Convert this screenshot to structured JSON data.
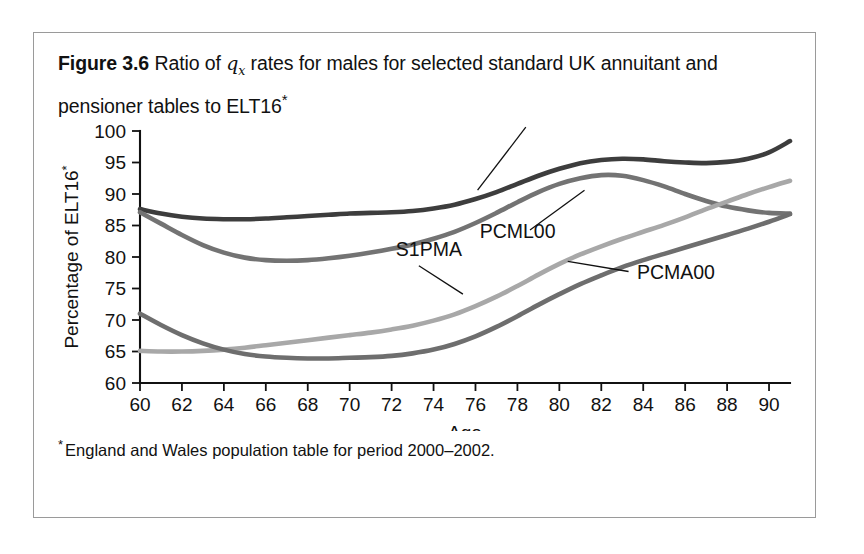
{
  "caption": {
    "figure_label": "Figure 3.6",
    "text_part1": " Ratio of ",
    "math_symbol": "q",
    "math_subscript": "x",
    "text_part2": " rates for males for selected standard UK annuitant and pensioner tables to ELT16",
    "footnote_marker": "*"
  },
  "footnote": {
    "marker": "*",
    "text": "England and Wales population table for period 2000–2002."
  },
  "chart_data": {
    "type": "line",
    "title": "Ratio of qx rates for males for selected standard UK annuitant and pensioner tables to ELT16",
    "xlabel": "Age",
    "ylabel": "Percentage of ELT16*",
    "xlim": [
      60,
      91
    ],
    "ylim": [
      60,
      100
    ],
    "xticks": [
      60,
      62,
      64,
      66,
      68,
      70,
      72,
      74,
      76,
      78,
      80,
      82,
      84,
      86,
      88,
      90
    ],
    "yticks": [
      60,
      65,
      70,
      75,
      80,
      85,
      90,
      95,
      100
    ],
    "grid": false,
    "legend": "inline-annotations",
    "x": [
      60,
      61,
      62,
      63,
      64,
      65,
      66,
      67,
      68,
      69,
      70,
      71,
      72,
      73,
      74,
      75,
      76,
      77,
      78,
      79,
      80,
      81,
      82,
      83,
      84,
      85,
      86,
      87,
      88,
      89,
      90,
      91
    ],
    "series": [
      {
        "name": "S1PML",
        "color": "#3d3d3d",
        "values": [
          87.6,
          86.9,
          86.4,
          86.1,
          86.0,
          86.0,
          86.1,
          86.3,
          86.5,
          86.7,
          86.9,
          87.0,
          87.1,
          87.3,
          87.7,
          88.3,
          89.2,
          90.3,
          91.6,
          92.9,
          94.0,
          94.9,
          95.4,
          95.6,
          95.5,
          95.2,
          95.0,
          94.9,
          95.1,
          95.6,
          96.6,
          98.4
        ],
        "label_position": {
          "x": 79.5,
          "y": 102.5
        },
        "leader_from": {
          "x": 78.4,
          "y": 100.6
        },
        "leader_to": {
          "x": 76.1,
          "y": 90.6
        }
      },
      {
        "name": "PCML00",
        "color": "#737373",
        "values": [
          87.1,
          85.3,
          83.5,
          81.9,
          80.7,
          79.9,
          79.5,
          79.4,
          79.5,
          79.8,
          80.2,
          80.7,
          81.3,
          82.0,
          82.9,
          84.0,
          85.4,
          87.0,
          88.7,
          90.3,
          91.6,
          92.5,
          93.0,
          92.9,
          92.2,
          91.2,
          90.0,
          88.9,
          88.0,
          87.4,
          87.0,
          86.9
        ],
        "label_position": {
          "x": 76.2,
          "y": 83.0
        },
        "leader_from": {
          "x": 78.6,
          "y": 84.3
        },
        "leader_to": {
          "x": 81.2,
          "y": 90.6
        }
      },
      {
        "name": "S1PMA",
        "color": "#a8a8a8",
        "values": [
          65.1,
          65.0,
          65.0,
          65.1,
          65.3,
          65.6,
          66.0,
          66.4,
          66.8,
          67.2,
          67.6,
          68.0,
          68.5,
          69.1,
          69.9,
          70.9,
          72.2,
          73.7,
          75.4,
          77.2,
          78.9,
          80.4,
          81.7,
          82.9,
          84.0,
          85.1,
          86.3,
          87.6,
          88.8,
          90.0,
          91.1,
          92.1
        ],
        "label_position": {
          "x": 72.2,
          "y": 80.1
        },
        "leader_from": {
          "x": 73.3,
          "y": 78.6
        },
        "leader_to": {
          "x": 75.4,
          "y": 74.1
        }
      },
      {
        "name": "PCMA00",
        "color": "#6e6e6e",
        "values": [
          71.0,
          69.2,
          67.6,
          66.3,
          65.3,
          64.6,
          64.2,
          64.0,
          63.9,
          63.9,
          64.0,
          64.1,
          64.3,
          64.7,
          65.3,
          66.2,
          67.4,
          68.9,
          70.6,
          72.4,
          74.1,
          75.7,
          77.1,
          78.4,
          79.5,
          80.5,
          81.5,
          82.5,
          83.5,
          84.5,
          85.6,
          86.8
        ],
        "label_position": {
          "x": 83.7,
          "y": 76.5
        },
        "leader_from": {
          "x": 83.3,
          "y": 77.7
        },
        "leader_to": {
          "x": 80.4,
          "y": 79.3
        }
      }
    ]
  }
}
